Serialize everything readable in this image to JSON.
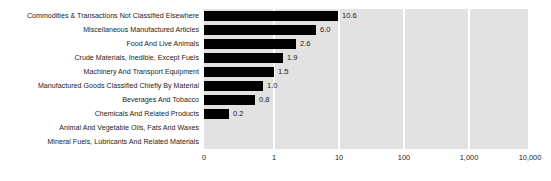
{
  "chart_data": {
    "type": "bar",
    "orientation": "horizontal",
    "title": "",
    "subtitle": "",
    "xlabel": "",
    "ylabel": "",
    "scale": "log",
    "grid": true,
    "legend": "none",
    "xticks": [
      "0",
      "1",
      "10",
      "100",
      "1,000",
      "10,000"
    ],
    "xtick_values": [
      0,
      1,
      10,
      100,
      1000,
      10000
    ],
    "xlim": [
      0,
      10000
    ],
    "categories": [
      "Commodities & Transactions Not Classified Elsewhere",
      "Miscellaneous Manufactured Articles",
      "Food And Live Animals",
      "Crude Materials, Inedible, Except Fuels",
      "Machinery And Transport Equipment",
      "Manufactured Goods Classified Chiefly By Material",
      "Beverages And Tobacco",
      "Chemicals And Related Products",
      "Animal And Vegetable Oils, Fats And Waxes",
      "Mineral Fuels, Lubricants And Related Materials"
    ],
    "values": [
      10.6,
      6.0,
      2.6,
      1.9,
      1.5,
      1.0,
      0.8,
      0.2,
      null,
      null
    ],
    "value_labels": [
      "10.6",
      "6.0",
      "2.6",
      "1.9",
      "1.5",
      "1.0",
      "0.8",
      "0.2",
      "",
      ""
    ],
    "bar_pixel_widths": [
      134,
      112,
      92,
      79,
      70,
      59,
      51,
      25,
      0,
      0
    ],
    "colors": {
      "bar": "#000000",
      "plot_background": "#e2e2e2",
      "gridline": "#ffffff",
      "page_background": "#ffffff",
      "text": "#1c1c1c"
    }
  }
}
